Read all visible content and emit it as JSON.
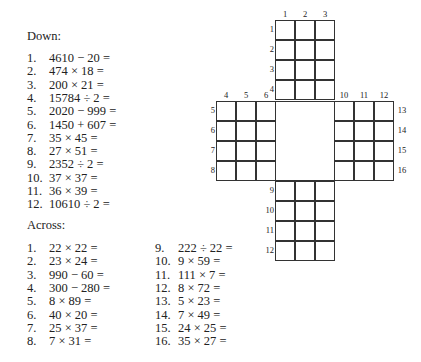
{
  "down": {
    "heading": "Down:",
    "clues": [
      {
        "num": "1.",
        "expr": "4610 − 20 ="
      },
      {
        "num": "2.",
        "expr": "474 × 18 ="
      },
      {
        "num": "3.",
        "expr": "200 × 21 ="
      },
      {
        "num": "4.",
        "expr": "15784 ÷ 2 ="
      },
      {
        "num": "5.",
        "expr": "2020 − 999 ="
      },
      {
        "num": "6.",
        "expr": "1450 + 607 ="
      },
      {
        "num": "7.",
        "expr": "35 × 45 ="
      },
      {
        "num": "8.",
        "expr": "27 × 51 ="
      },
      {
        "num": "9.",
        "expr": "2352 ÷ 2 ="
      },
      {
        "num": "10.",
        "expr": "37 × 37 ="
      },
      {
        "num": "11.",
        "expr": "36 × 39 ="
      },
      {
        "num": "12.",
        "expr": "10610 ÷ 2 ="
      }
    ]
  },
  "across": {
    "heading": "Across:",
    "clues": [
      {
        "num": "1.",
        "expr": "22 × 22 ="
      },
      {
        "num": "2.",
        "expr": "23 × 24 ="
      },
      {
        "num": "3.",
        "expr": "990 − 60 ="
      },
      {
        "num": "4.",
        "expr": "300 − 280 ="
      },
      {
        "num": "5.",
        "expr": "8 × 89 ="
      },
      {
        "num": "6.",
        "expr": "40 × 20 ="
      },
      {
        "num": "7.",
        "expr": "25 × 37 ="
      },
      {
        "num": "8.",
        "expr": "7 × 31 ="
      },
      {
        "num": "9.",
        "expr": "222 ÷ 22 ="
      },
      {
        "num": "10.",
        "expr": "9 × 59 ="
      },
      {
        "num": "11.",
        "expr": "111 × 7 ="
      },
      {
        "num": "12.",
        "expr": "8 × 72 ="
      },
      {
        "num": "13.",
        "expr": "5 × 23 ="
      },
      {
        "num": "14.",
        "expr": "7 × 49 ="
      },
      {
        "num": "15.",
        "expr": "24 × 25 ="
      },
      {
        "num": "16.",
        "expr": "35 × 27 ="
      }
    ]
  },
  "grid": {
    "top_block": {
      "col_labels": [
        "1",
        "2",
        "3"
      ],
      "row_labels": [
        "1",
        "2",
        "3",
        "4"
      ]
    },
    "left_block": {
      "col_labels": [
        "4",
        "5",
        "6"
      ],
      "row_labels": [
        "5",
        "6",
        "7",
        "8"
      ]
    },
    "right_block": {
      "col_labels": [
        "10",
        "11",
        "12"
      ],
      "row_labels": [
        "13",
        "14",
        "15",
        "16"
      ]
    },
    "bottom_block": {
      "col_labels": [
        "7",
        "8",
        "9"
      ],
      "row_labels": [
        "9",
        "10",
        "11",
        "12"
      ]
    }
  }
}
